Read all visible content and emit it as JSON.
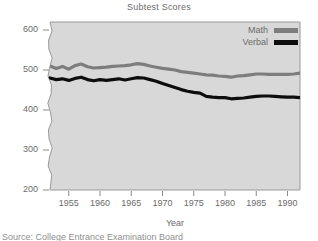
{
  "chart_data": {
    "type": "line",
    "title": "Subtest Scores",
    "xlabel": "Year",
    "ylabel": "",
    "xlim": [
      1952,
      1992
    ],
    "ylim": [
      200,
      620
    ],
    "yaxis_break": true,
    "grid": false,
    "legend_position": "top-right",
    "y_ticks": [
      200,
      300,
      400,
      500,
      600
    ],
    "x_ticks": [
      1955,
      1960,
      1965,
      1970,
      1975,
      1980,
      1985,
      1990
    ],
    "x": [
      1952,
      1953,
      1954,
      1955,
      1956,
      1957,
      1958,
      1959,
      1960,
      1961,
      1962,
      1963,
      1964,
      1965,
      1966,
      1967,
      1968,
      1969,
      1970,
      1971,
      1972,
      1973,
      1974,
      1975,
      1976,
      1977,
      1978,
      1979,
      1980,
      1981,
      1982,
      1983,
      1984,
      1985,
      1986,
      1987,
      1988,
      1989,
      1990,
      1991,
      1992
    ],
    "series": [
      {
        "name": "Math",
        "color": "#7d7d7d",
        "values": [
          510,
          504,
          509,
          502,
          511,
          515,
          508,
          505,
          506,
          507,
          509,
          510,
          511,
          513,
          516,
          514,
          510,
          507,
          504,
          502,
          500,
          496,
          494,
          492,
          490,
          488,
          487,
          485,
          484,
          482,
          485,
          486,
          488,
          490,
          490,
          489,
          489,
          489,
          489,
          490,
          492
        ]
      },
      {
        "name": "Verbal",
        "color": "#0d0d0d",
        "values": [
          480,
          476,
          478,
          474,
          479,
          482,
          476,
          473,
          476,
          474,
          476,
          478,
          475,
          478,
          481,
          480,
          476,
          472,
          466,
          461,
          456,
          451,
          447,
          444,
          442,
          434,
          432,
          431,
          431,
          428,
          429,
          430,
          432,
          434,
          435,
          435,
          434,
          433,
          432,
          432,
          431
        ]
      }
    ]
  },
  "legend": {
    "items": [
      {
        "label": "Math",
        "color": "#7d7d7d"
      },
      {
        "label": "Verbal",
        "color": "#0d0d0d"
      }
    ]
  },
  "footer": {
    "text": "Source: College Entrance Examination Board"
  },
  "colors": {
    "plot_background": "#d8d8d8",
    "axis": "#8a8a8a",
    "text": "#6b6b6b",
    "math_line": "#7d7d7d",
    "verbal_line": "#0d0d0d"
  }
}
